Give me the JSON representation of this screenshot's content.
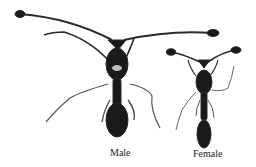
{
  "figure": {
    "subjects": [
      {
        "name": "male",
        "label": "Male"
      },
      {
        "name": "female",
        "label": "Female"
      }
    ]
  }
}
